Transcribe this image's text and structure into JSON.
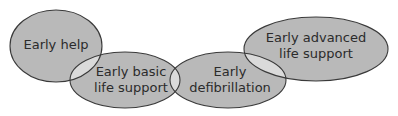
{
  "diagram": {
    "type": "chain-of-survival-overlapping-ellipses",
    "colors": {
      "fill": "#b9b9b9",
      "overlap": "#dadada",
      "stroke": "#3a3a3a",
      "text": "#2b2b2b",
      "background": "#ffffff"
    },
    "nodes": [
      {
        "id": "early-help",
        "line1": "Early help",
        "line2": ""
      },
      {
        "id": "early-basic-life-support",
        "line1": "Early basic",
        "line2": "life support"
      },
      {
        "id": "early-defibrillation",
        "line1": "Early",
        "line2": "defibrillation"
      },
      {
        "id": "early-advanced-life-support",
        "line1": "Early advanced",
        "line2": "life support"
      }
    ]
  }
}
